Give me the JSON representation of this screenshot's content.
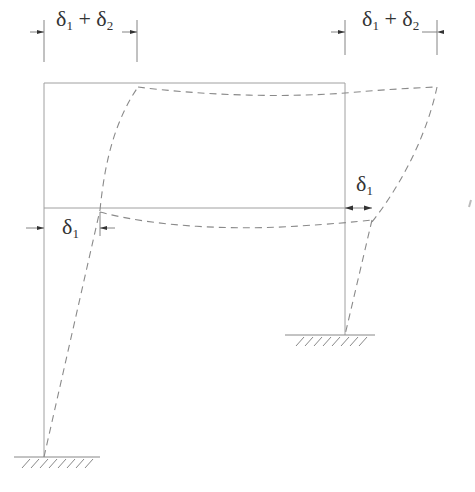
{
  "diagram": {
    "type": "structural-frame-sway",
    "colors": {
      "frame": "#9a9a9a",
      "deflected": "#8a8a8a",
      "dimension": "#555555",
      "text": "#333333"
    },
    "labels": {
      "top_left": {
        "symbol": "δ",
        "sub1": "1",
        "plus": " + ",
        "symbol2": "δ",
        "sub2": "2"
      },
      "top_right": {
        "symbol": "δ",
        "sub1": "1",
        "plus": " + ",
        "symbol2": "δ",
        "sub2": "2"
      },
      "mid_left": {
        "symbol": "δ",
        "sub1": "1"
      },
      "mid_right": {
        "symbol": "δ",
        "sub1": "1"
      }
    },
    "frame": {
      "left_column": {
        "x": 44,
        "y_top": 83,
        "y_base": 457
      },
      "right_column": {
        "x": 345,
        "y_top": 83,
        "y_base": 335
      },
      "top_beam": {
        "y": 83
      },
      "mid_beam": {
        "y": 208
      }
    },
    "supports": [
      {
        "name": "left-fixed-support",
        "x": 44,
        "y": 457
      },
      {
        "name": "right-fixed-support",
        "x": 345,
        "y": 335
      }
    ]
  }
}
